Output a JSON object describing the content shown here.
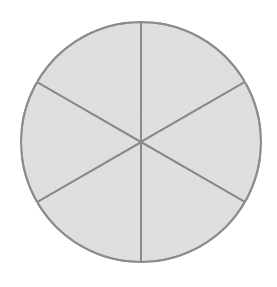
{
  "chart_data": {
    "type": "pie",
    "title": "",
    "categories": [
      "Sector 1",
      "Sector 2",
      "Sector 3",
      "Sector 4",
      "Sector 5",
      "Sector 6"
    ],
    "values": [
      1,
      1,
      1,
      1,
      1,
      1
    ],
    "legend": "none",
    "labels_visible": false,
    "start_angle_deg": 90,
    "fill_color": "#e3e3e3",
    "stroke_color": "#8c8c8c",
    "center": [
      141,
      142
    ],
    "radius": 120
  }
}
